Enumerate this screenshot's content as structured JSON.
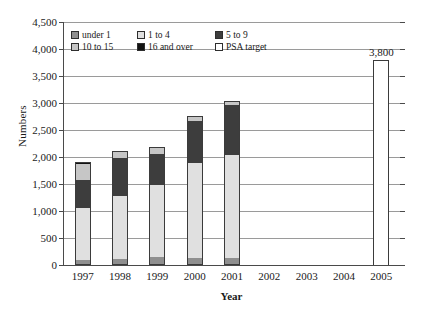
{
  "chart_data": {
    "type": "bar",
    "subtype": "stacked",
    "title": "",
    "xlabel": "Year",
    "ylabel": "Numbers",
    "categories": [
      "1997",
      "1998",
      "1999",
      "2000",
      "2001",
      "2002",
      "2003",
      "2004",
      "2005"
    ],
    "ylim": [
      0,
      4500
    ],
    "ytick_labels": [
      "0",
      "500",
      "1,000",
      "1,500",
      "2,000",
      "2,500",
      "3,000",
      "3,500",
      "4,000",
      "4,500"
    ],
    "ytick_values": [
      0,
      500,
      1000,
      1500,
      2000,
      2500,
      3000,
      3500,
      4000,
      4500
    ],
    "grid": true,
    "legend_position": "top-left",
    "series": [
      {
        "name": "under 1",
        "color": "#8f8f8f",
        "values": [
          90,
          110,
          150,
          130,
          130,
          null,
          null,
          null,
          null
        ]
      },
      {
        "name": "1 to 4",
        "color": "#e0e0e0",
        "values": [
          960,
          1160,
          1340,
          1750,
          1900,
          null,
          null,
          null,
          null
        ]
      },
      {
        "name": "5 to 9",
        "color": "#3d3d3d",
        "values": [
          520,
          720,
          570,
          790,
          930,
          null,
          null,
          null,
          null
        ]
      },
      {
        "name": "10 to 15",
        "color": "#c6c6c6",
        "values": [
          300,
          110,
          100,
          70,
          50,
          null,
          null,
          null,
          null
        ]
      },
      {
        "name": "16 and over",
        "color": "#121212",
        "values": [
          40,
          20,
          20,
          20,
          15,
          null,
          null,
          null,
          null
        ]
      },
      {
        "name": "PSA target",
        "color": "#ffffff",
        "values": [
          null,
          null,
          null,
          null,
          null,
          null,
          null,
          null,
          3800
        ]
      }
    ],
    "totals": [
      1910,
      2120,
      2180,
      2760,
      3025,
      null,
      null,
      null,
      3800
    ],
    "data_labels": {
      "2005": "3,800"
    },
    "annotations": [
      {
        "category": "2005",
        "text": "3,800",
        "position": "above-bar"
      }
    ]
  },
  "legend": {
    "items": [
      {
        "label": "under 1"
      },
      {
        "label": "1 to 4"
      },
      {
        "label": "5 to 9"
      },
      {
        "label": "10 to 15"
      },
      {
        "label": "16 and over"
      },
      {
        "label": "PSA target"
      }
    ]
  },
  "axes": {
    "y_title": "Numbers",
    "x_title": "Year"
  }
}
